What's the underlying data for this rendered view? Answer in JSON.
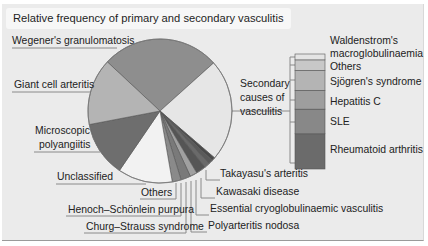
{
  "title": "Relative frequency of primary and secondary vasculitis",
  "chart_data": [
    {
      "type": "pie",
      "title": "Relative frequency of primary and secondary vasculitis",
      "slices": [
        {
          "label": "Wegener's granulomatosis",
          "value": 26.5,
          "color": "#8e8e8e"
        },
        {
          "label": "Secondary causes of vasculitis",
          "value": 23.0,
          "color": "#e6e6e6"
        },
        {
          "label": "Takayasu's arteritis",
          "value": 0.8,
          "color": "#4a4a4a"
        },
        {
          "label": "Kawasaki disease",
          "value": 1.0,
          "color": "#5a5a5a"
        },
        {
          "label": "Essential cryoglobulinaemic vasculitis",
          "value": 1.2,
          "color": "#6a6a6a"
        },
        {
          "label": "Polyarteritis nodosa",
          "value": 2.2,
          "color": "#555555"
        },
        {
          "label": "Churg–Strauss syndrome",
          "value": 1.6,
          "color": "#a0a0a0"
        },
        {
          "label": "Henoch–Schönlein purpura",
          "value": 2.2,
          "color": "#7a7a7a"
        },
        {
          "label": "Others",
          "value": 2.0,
          "color": "#8a8a8a"
        },
        {
          "label": "Unclassified",
          "value": 12.3,
          "color": "#f2f2f2"
        },
        {
          "label": "Microscopic polyangiitis",
          "value": 12.5,
          "color": "#6e6e6e"
        },
        {
          "label": "Giant cell arteritis",
          "value": 15.0,
          "color": "#b4b4b4"
        }
      ],
      "legend": "leader-line labels"
    },
    {
      "type": "bar",
      "title": "Secondary causes of vasculitis",
      "stacked": true,
      "categories": [
        "Rheumatoid arthritis",
        "SLE",
        "Hepatitis C",
        "Sjögren's syndrome",
        "Others",
        "Waldenstrom's macroglobulinaemia"
      ],
      "values": [
        30,
        21,
        16,
        17,
        9,
        5
      ],
      "colors": [
        "#6b6b6b",
        "#888888",
        "#9e9e9e",
        "#b4b4b4",
        "#c8c8c8",
        "#e4e4e4"
      ]
    }
  ],
  "labels": {
    "wegener": "Wegener's granulomatosis",
    "giant": "Giant cell arteritis",
    "micro1": "Microscopic",
    "micro2": "polyangiitis",
    "unclassified": "Unclassified",
    "others": "Others",
    "henoch": "Henoch–Schönlein purpura",
    "churg": "Churg–Strauss syndrome",
    "takayasu": "Takayasu's arteritis",
    "kawasaki": "Kawasaki disease",
    "cryo": "Essential cryoglobulinaemic vasculitis",
    "pan": "Polyarteritis nodosa",
    "secondary1": "Secondary",
    "secondary2": "causes of",
    "secondary3": "vasculitis"
  },
  "bar_labels": {
    "wald1": "Waldenstrom's",
    "wald2": "macroglobulinaemia",
    "others": "Others",
    "sjogren": "Sjögren's syndrome",
    "hepc": "Hepatitis C",
    "sle": "SLE",
    "ra": "Rheumatoid arthritis"
  }
}
